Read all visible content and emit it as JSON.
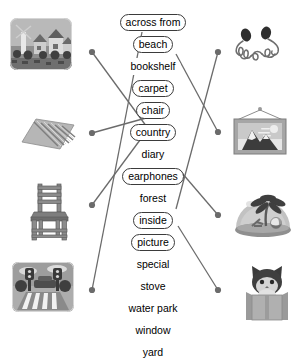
{
  "activity": {
    "title": "Picture to word matching worksheet",
    "type": "match-the-picture-to-the-word"
  },
  "words": [
    {
      "label": "across from",
      "boxed": true
    },
    {
      "label": "beach",
      "boxed": true
    },
    {
      "label": "bookshelf",
      "boxed": false
    },
    {
      "label": "carpet",
      "boxed": true
    },
    {
      "label": "chair",
      "boxed": true
    },
    {
      "label": "country",
      "boxed": true
    },
    {
      "label": "diary",
      "boxed": false
    },
    {
      "label": "earphones",
      "boxed": true
    },
    {
      "label": "forest",
      "boxed": false
    },
    {
      "label": "inside",
      "boxed": true
    },
    {
      "label": "picture",
      "boxed": true
    },
    {
      "label": "special",
      "boxed": false
    },
    {
      "label": "stove",
      "boxed": false
    },
    {
      "label": "water park",
      "boxed": false
    },
    {
      "label": "window",
      "boxed": false
    },
    {
      "label": "yard",
      "boxed": false
    }
  ],
  "left_images": [
    {
      "name": "country-village-photo",
      "alt": "country village with houses and windmill"
    },
    {
      "name": "carpet-rug-photo",
      "alt": "striped carpet rug"
    },
    {
      "name": "wooden-chair-photo",
      "alt": "wooden ladder-back chair"
    },
    {
      "name": "crosswalk-photo",
      "alt": "crosswalk with traffic lights"
    }
  ],
  "right_images": [
    {
      "name": "earphones-photo",
      "alt": "tangled earphones"
    },
    {
      "name": "framed-picture-photo",
      "alt": "framed mountain picture hanging on wall"
    },
    {
      "name": "snow-globe-beach-photo",
      "alt": "beach snow globe with palm tree"
    },
    {
      "name": "cat-in-box-photo",
      "alt": "cat inside a cardboard box"
    }
  ],
  "connections": [
    {
      "from": "country-village-photo",
      "to": "country"
    },
    {
      "from": "carpet-rug-photo",
      "to": "carpet"
    },
    {
      "from": "wooden-chair-photo",
      "to": "chair"
    },
    {
      "from": "crosswalk-photo",
      "to": "across from"
    },
    {
      "from": "earphones-photo",
      "to": "inside"
    },
    {
      "from": "framed-picture-photo",
      "to": "beach"
    },
    {
      "from": "snow-globe-beach-photo",
      "to": "earphones"
    },
    {
      "from": "cat-in-box-photo",
      "to": "picture"
    }
  ],
  "colors": {
    "line": "#6b6b6b",
    "word_border": "#3b3b3b",
    "text": "#000000",
    "background": "#ffffff"
  }
}
